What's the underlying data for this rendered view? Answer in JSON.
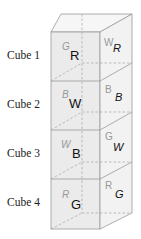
{
  "diagram": {
    "type": "stacked-cubes",
    "colors": {
      "face_front": "#e9e9e9",
      "face_right": "#f1f1f1",
      "face_top": "#f6f6f6",
      "edge": "#9a9a9a",
      "hidden_edge": "#9a9a9a",
      "letter_front": "#111111",
      "letter_hidden": "#999999"
    },
    "cubes": [
      {
        "label": "Cube 1",
        "front": {
          "visible": "R",
          "hidden": "G"
        },
        "right": {
          "visible": "R",
          "hidden": "W"
        }
      },
      {
        "label": "Cube 2",
        "front": {
          "visible": "W",
          "hidden": "B"
        },
        "right": {
          "visible": "B",
          "hidden": "B"
        }
      },
      {
        "label": "Cube 3",
        "front": {
          "visible": "B",
          "hidden": "W"
        },
        "right": {
          "visible": "W",
          "hidden": "G"
        }
      },
      {
        "label": "Cube 4",
        "front": {
          "visible": "G",
          "hidden": "R"
        },
        "right": {
          "visible": "G",
          "hidden": "R"
        }
      }
    ]
  }
}
